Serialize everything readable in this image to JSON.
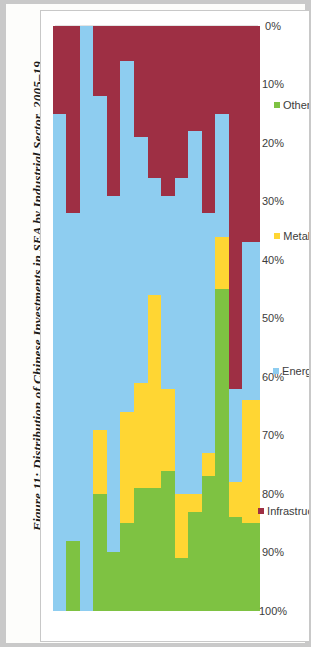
{
  "figure": {
    "title": "Figure 11: Distribution of Chinese Investments in SEA by Industrial Sector, 2005–19"
  },
  "legend": {
    "position": "right",
    "items": [
      {
        "label": "Infrastructure",
        "color": "#9e2f44"
      },
      {
        "label": "Energy",
        "color": "#8ecdf0"
      },
      {
        "label": "Metals",
        "color": "#ffd633"
      },
      {
        "label": "Others",
        "color": "#7ec242"
      }
    ]
  },
  "axis": {
    "value_ticks": [
      "100%",
      "90%",
      "80%",
      "70%",
      "60%",
      "50%",
      "40%",
      "30%",
      "20%",
      "10%",
      "0%"
    ]
  },
  "chart_data": {
    "type": "bar",
    "orientation": "horizontal-stacked-100",
    "title": "Figure 11: Distribution of Chinese Investments in SEA by Industrial Sector, 2005–19",
    "xlabel": "",
    "ylabel": "",
    "xlim": [
      0,
      100
    ],
    "grid": true,
    "stacked": true,
    "normalized_percent": true,
    "categories": [
      "2005",
      "2006",
      "2007",
      "2008",
      "2009",
      "2010",
      "2011",
      "2012",
      "2013",
      "2014",
      "2015",
      "2016",
      "2017",
      "2018",
      "2019"
    ],
    "series": [
      {
        "name": "Others",
        "color": "#7ec242",
        "values": [
          0,
          12,
          0,
          20,
          10,
          15,
          21,
          21,
          24,
          9,
          17,
          23,
          55,
          16,
          15
        ]
      },
      {
        "name": "Metals",
        "color": "#ffd633",
        "values": [
          0,
          0,
          0,
          11,
          0,
          19,
          18,
          33,
          14,
          11,
          3,
          4,
          9,
          6,
          21
        ]
      },
      {
        "name": "Energy",
        "color": "#8ecdf0",
        "values": [
          85,
          56,
          100,
          57,
          61,
          60,
          42,
          20,
          33,
          54,
          62,
          41,
          21,
          16,
          27
        ]
      },
      {
        "name": "Infrastructure",
        "color": "#9e2f44",
        "values": [
          15,
          32,
          0,
          12,
          29,
          6,
          19,
          26,
          29,
          26,
          18,
          32,
          15,
          62,
          37
        ]
      }
    ]
  }
}
